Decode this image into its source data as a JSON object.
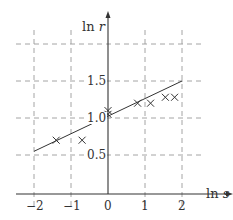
{
  "chart_data": {
    "type": "scatter",
    "title": "",
    "xlabel": "ln s",
    "ylabel": "ln r",
    "xlabel_parts": {
      "fn": "ln",
      "var": "s"
    },
    "ylabel_parts": {
      "fn": "ln",
      "var": "r"
    },
    "xlim": [
      -2.4,
      2.9
    ],
    "ylim": [
      0,
      2.0
    ],
    "x_ticks": [
      -2,
      -1,
      0,
      1,
      2
    ],
    "x_tick_labels": [
      "−2",
      "−1",
      "0",
      "1",
      "2"
    ],
    "y_ticks": [
      0.5,
      1.0,
      1.5
    ],
    "y_tick_labels": [
      "0.5",
      "1.0",
      "1.5"
    ],
    "grid": true,
    "grid_style": "dashed",
    "grid_y_extra": [
      2.0
    ],
    "marker": "x",
    "series": [
      {
        "name": "data",
        "points": [
          {
            "x": -1.4,
            "y": 0.7
          },
          {
            "x": -0.7,
            "y": 0.7
          },
          {
            "x": 0.0,
            "y": 1.05
          },
          {
            "x": 0.0,
            "y": 1.1
          },
          {
            "x": 0.8,
            "y": 1.2
          },
          {
            "x": 1.15,
            "y": 1.2
          },
          {
            "x": 1.55,
            "y": 1.28
          },
          {
            "x": 1.8,
            "y": 1.28
          }
        ]
      }
    ],
    "fit_line": {
      "x": [
        -2,
        2
      ],
      "y": [
        0.55,
        1.5
      ]
    },
    "colors": {
      "ink": "#333333",
      "grid": "#9a9a9a"
    }
  }
}
